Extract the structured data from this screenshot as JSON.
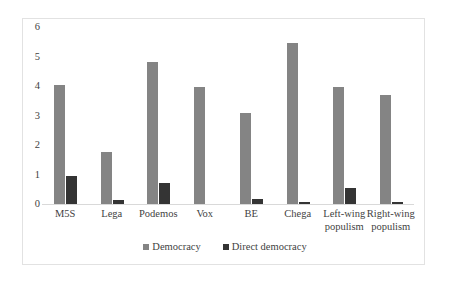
{
  "chart_data": {
    "type": "bar",
    "title": "",
    "xlabel": "",
    "ylabel": "",
    "ylim": [
      0,
      6
    ],
    "yticks": [
      0,
      1,
      2,
      3,
      4,
      5,
      6
    ],
    "grid": false,
    "legend_position": "bottom",
    "categories": [
      "M5S",
      "Lega",
      "Podemos",
      "Vox",
      "BE",
      "Chega",
      "Left-wing\npopulism",
      "Right-wing\npopulism"
    ],
    "series": [
      {
        "name": "Democracy",
        "color": "#848484",
        "values": [
          4.05,
          1.78,
          4.8,
          3.95,
          3.1,
          5.46,
          3.95,
          3.7
        ]
      },
      {
        "name": "Direct democracy",
        "color": "#343434",
        "values": [
          0.95,
          0.13,
          0.7,
          0,
          0.18,
          0.07,
          0.55,
          0.06
        ]
      }
    ]
  },
  "axis": {
    "y_tick_labels": [
      "0",
      "1",
      "2",
      "3",
      "4",
      "5",
      "6"
    ]
  },
  "legend": {
    "items": [
      {
        "label": "Democracy",
        "color": "#848484"
      },
      {
        "label": "Direct democracy",
        "color": "#343434"
      }
    ]
  }
}
